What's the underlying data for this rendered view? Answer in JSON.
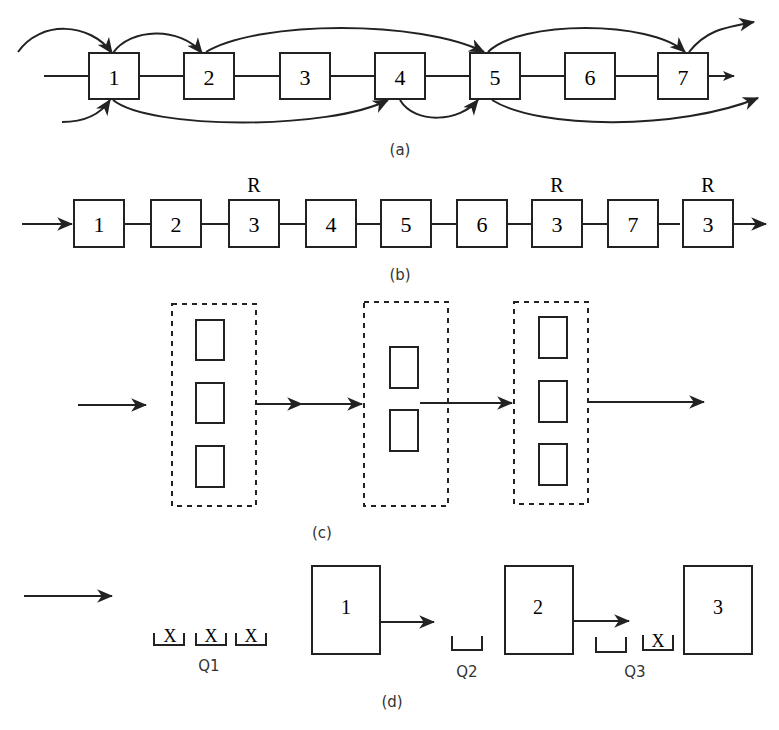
{
  "panels": {
    "a": {
      "caption": "(a)",
      "nodes": [
        "1",
        "2",
        "3",
        "4",
        "5",
        "6",
        "7"
      ],
      "arcs_above": [
        [
          "in",
          "1"
        ],
        [
          "1",
          "2"
        ],
        [
          "2",
          "5"
        ],
        [
          "5",
          "7"
        ],
        [
          "7",
          "out"
        ]
      ],
      "arcs_below": [
        [
          "in",
          "1"
        ],
        [
          "1",
          "4"
        ],
        [
          "4",
          "5"
        ],
        [
          "5",
          "out"
        ]
      ]
    },
    "b": {
      "caption": "(b)",
      "nodes": [
        "1",
        "2",
        "3",
        "4",
        "5",
        "6",
        "3",
        "7",
        "3"
      ],
      "labels_above": [
        "",
        "",
        "R",
        "",
        "",
        "",
        "R",
        "",
        "R"
      ]
    },
    "c": {
      "caption": "(c)",
      "groups": [
        3,
        2,
        3
      ]
    },
    "d": {
      "caption": "(d)",
      "stations": [
        "1",
        "2",
        "3"
      ],
      "queues": [
        {
          "label": "Q1",
          "items": [
            "X",
            "X",
            "X"
          ]
        },
        {
          "label": "Q2",
          "items": [
            ""
          ]
        },
        {
          "label": "Q3",
          "items": [
            "",
            "X"
          ]
        }
      ]
    }
  },
  "colors": {
    "stroke": "#222222",
    "background": "#ffffff"
  }
}
